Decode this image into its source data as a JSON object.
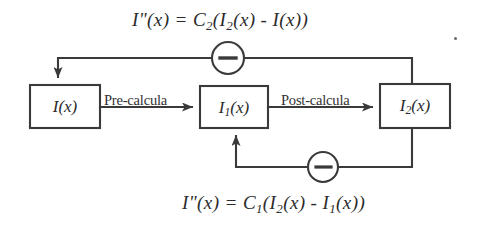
{
  "diagram": {
    "type": "block-diagram",
    "canvas": {
      "width": 488,
      "height": 233
    },
    "stroke_color": "#3a3a3a",
    "text_color": "#2b2b2b",
    "background": "#ffffff",
    "blocks": [
      {
        "id": "block-i",
        "label_html": "I(x)",
        "label_text": "I(x)",
        "x": 30,
        "y": 85,
        "width": 70,
        "height": 43
      },
      {
        "id": "block-i1",
        "label_html": "I<sub>1</sub>(x)",
        "label_text": "I1(x)",
        "x": 200,
        "y": 86,
        "width": 68,
        "height": 42
      },
      {
        "id": "block-i2",
        "label_html": "I<sub>2</sub>(x)",
        "label_text": "I2(x)",
        "x": 380,
        "y": 84,
        "width": 70,
        "height": 44
      }
    ],
    "edge_labels": [
      {
        "id": "label-pre",
        "text": "Pre-calcula"
      },
      {
        "id": "label-post",
        "text": "Post-calcula"
      }
    ],
    "summing_junctions": [
      {
        "id": "sum-top",
        "sign": "−",
        "cx": 228,
        "cy": 58,
        "r": 16
      },
      {
        "id": "sum-bottom",
        "sign": "−",
        "cx": 323,
        "cy": 167,
        "r": 15
      }
    ],
    "equations": [
      {
        "id": "eq-top",
        "html": "I&quot;(x) = C<sub>2</sub>(I<sub>2</sub>(x) - I(x))",
        "text": "I\"(x) = C2(I2(x) - I(x))",
        "describes": "outer feedback loop into I(x)"
      },
      {
        "id": "eq-bottom",
        "html": "I&quot;(x) = C<sub>1</sub>(I<sub>2</sub>(x) - I<sub>1</sub>(x))",
        "text": "I\"(x) = C1(I2(x) - I1(x))",
        "describes": "inner feedback loop into I1(x)"
      }
    ],
    "connections": [
      {
        "id": "conn-i-to-i1",
        "from": "block-i",
        "to": "block-i1",
        "label": "Pre-calcula",
        "arrow": true
      },
      {
        "id": "conn-i1-to-i2",
        "from": "block-i1",
        "to": "block-i2",
        "label": "Post-calcula",
        "arrow": true
      },
      {
        "id": "conn-outer-feedback",
        "from": "block-i2",
        "to": "block-i",
        "via": "sum-top",
        "arrow": true
      },
      {
        "id": "conn-inner-feedback",
        "from": "block-i2",
        "to": "block-i1",
        "via": "sum-bottom",
        "arrow": true
      }
    ],
    "artifacts": [
      {
        "id": "speck",
        "kind": "scan-speck",
        "x": 454,
        "y": 37
      }
    ]
  }
}
